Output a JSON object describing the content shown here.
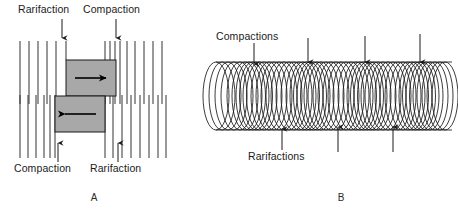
{
  "figure": {
    "background": "#ffffff",
    "ink_color": "#1b1b1b",
    "box_fill": "#a8a8a8",
    "panels": [
      {
        "id": "A",
        "caption": "A",
        "caption_x": 94,
        "caption_y": 201,
        "labels": [
          {
            "name": "top-left-label",
            "text": "Rarifaction",
            "x": 18,
            "y": 13,
            "anchor": "start"
          },
          {
            "name": "top-right-label",
            "text": "Compaction",
            "x": 83,
            "y": 13,
            "anchor": "start"
          },
          {
            "name": "bottom-left-label",
            "text": "Compaction",
            "x": 14,
            "y": 172,
            "anchor": "start"
          },
          {
            "name": "bottom-right-label",
            "text": "Rarifaction",
            "x": 90,
            "y": 172,
            "anchor": "start"
          }
        ],
        "arrows": [
          {
            "name": "arrow-top-rarifaction",
            "x": 62,
            "y1": 19,
            "y2": 38,
            "dir": "down"
          },
          {
            "name": "arrow-top-compaction",
            "x": 116,
            "y1": 19,
            "y2": 38,
            "dir": "down"
          },
          {
            "name": "arrow-bottom-compaction",
            "x": 58,
            "y1": 162,
            "y2": 143,
            "dir": "up"
          },
          {
            "name": "arrow-bottom-rarifaction",
            "x": 118,
            "y1": 162,
            "y2": 143,
            "dir": "up"
          }
        ],
        "upper_wave": {
          "y_top": 41,
          "y_bottom": 104,
          "x_positions": [
            20,
            29,
            38,
            47,
            56,
            66,
            90,
            105,
            110,
            115,
            120,
            127,
            135,
            144,
            153,
            162
          ]
        },
        "lower_wave": {
          "y_top": 95,
          "y_bottom": 158,
          "x_positions": [
            20,
            28,
            36,
            44,
            50,
            55,
            60,
            65,
            70,
            95,
            105,
            115,
            125,
            135,
            145,
            155,
            164
          ]
        },
        "boxes": [
          {
            "name": "compression-block-upper",
            "x": 66,
            "y": 60,
            "w": 50,
            "h": 36,
            "arrow": "right"
          },
          {
            "name": "compression-block-lower",
            "x": 55,
            "y": 96,
            "w": 50,
            "h": 36,
            "arrow": "left"
          }
        ]
      },
      {
        "id": "B",
        "caption": "B",
        "caption_x": 341,
        "caption_y": 201,
        "labels": [
          {
            "name": "compactions-label",
            "text": "Compactions",
            "x": 216,
            "y": 40,
            "anchor": "start"
          },
          {
            "name": "rarifactions-label",
            "text": "Rarifactions",
            "x": 248,
            "y": 160,
            "anchor": "start"
          }
        ],
        "arrows_down": [
          {
            "name": "arrow-compaction-1",
            "x": 254,
            "y1": 43,
            "y2": 64
          },
          {
            "name": "arrow-compaction-2",
            "x": 308,
            "y1": 38,
            "y2": 62
          },
          {
            "name": "arrow-compaction-3",
            "x": 365,
            "y1": 36,
            "y2": 62
          },
          {
            "name": "arrow-compaction-4",
            "x": 420,
            "y1": 34,
            "y2": 62
          }
        ],
        "arrows_up": [
          {
            "name": "arrow-rarifaction-1",
            "x": 282,
            "y1": 150,
            "y2": 130
          },
          {
            "name": "arrow-rarifaction-2",
            "x": 338,
            "y1": 152,
            "y2": 128
          },
          {
            "name": "arrow-rarifaction-3",
            "x": 393,
            "y1": 152,
            "y2": 128
          }
        ],
        "spring": {
          "x_start": 214,
          "x_end": 452,
          "y_center": 96,
          "ry": 34,
          "rx": 13,
          "coil_x_positions": [
            216,
            222,
            228,
            234,
            240,
            245,
            249,
            252.5,
            256,
            259.5,
            264,
            269,
            274,
            279,
            284,
            289,
            294,
            299,
            303,
            306.5,
            310,
            313.5,
            317,
            321,
            326,
            331,
            336,
            341,
            346,
            351,
            356,
            360,
            363.5,
            367,
            370.5,
            374,
            378,
            383,
            388,
            393,
            398,
            403,
            408,
            412,
            415.5,
            419,
            422.5,
            426,
            430,
            435,
            440,
            445
          ]
        }
      }
    ]
  },
  "chart_data": {
    "type": "diagram",
    "panels": [
      "A",
      "B"
    ],
    "panel_a_terms": [
      "Rarifaction",
      "Compaction"
    ],
    "panel_b_terms": [
      "Compactions",
      "Rarifactions"
    ],
    "panel_b_compaction_arrow_count": 4,
    "panel_b_rarifaction_arrow_count": 3
  }
}
